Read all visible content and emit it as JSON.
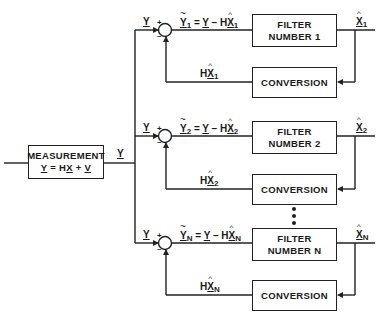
{
  "measurement": {
    "title": "MEASUREMENT",
    "equation": {
      "lhs": "Y",
      "eq": " = H",
      "x": "X",
      "plus": " + ",
      "v": "V"
    },
    "output_label": "Y"
  },
  "branches": [
    {
      "input_label": "Y",
      "plus_sign": "+",
      "minus_sign": "–",
      "residual": {
        "y": "Y",
        "sub": "1",
        "eq": " = ",
        "y2": "Y",
        "minus": " – H",
        "x": "X",
        "xsub": "1"
      },
      "filter": {
        "line1": "FILTER",
        "line2": "NUMBER 1"
      },
      "output": {
        "x": "X",
        "sub": "1"
      },
      "conversion": "CONVERSION",
      "feedback": {
        "h": "H",
        "x": "X",
        "sub": "1"
      }
    },
    {
      "input_label": "Y",
      "plus_sign": "+",
      "minus_sign": "–",
      "residual": {
        "y": "Y",
        "sub": "2",
        "eq": " = ",
        "y2": "Y",
        "minus": " – H",
        "x": "X",
        "xsub": "2"
      },
      "filter": {
        "line1": "FILTER",
        "line2": "NUMBER 2"
      },
      "output": {
        "x": "X",
        "sub": "2"
      },
      "conversion": "CONVERSION",
      "feedback": {
        "h": "H",
        "x": "X",
        "sub": "2"
      }
    },
    {
      "input_label": "Y",
      "plus_sign": "+",
      "minus_sign": "–",
      "residual": {
        "y": "Y",
        "sub": "N",
        "eq": " = ",
        "y2": "Y",
        "minus": " – H",
        "x": "X",
        "xsub": "N"
      },
      "filter": {
        "line1": "FILTER",
        "line2": "NUMBER N"
      },
      "output": {
        "x": "X",
        "sub": "N"
      },
      "conversion": "CONVERSION",
      "feedback": {
        "h": "H",
        "x": "X",
        "sub": "N"
      }
    }
  ],
  "ellipsis": "vertical-dots",
  "colors": {
    "line": "#222222",
    "background": "#ffffff"
  }
}
